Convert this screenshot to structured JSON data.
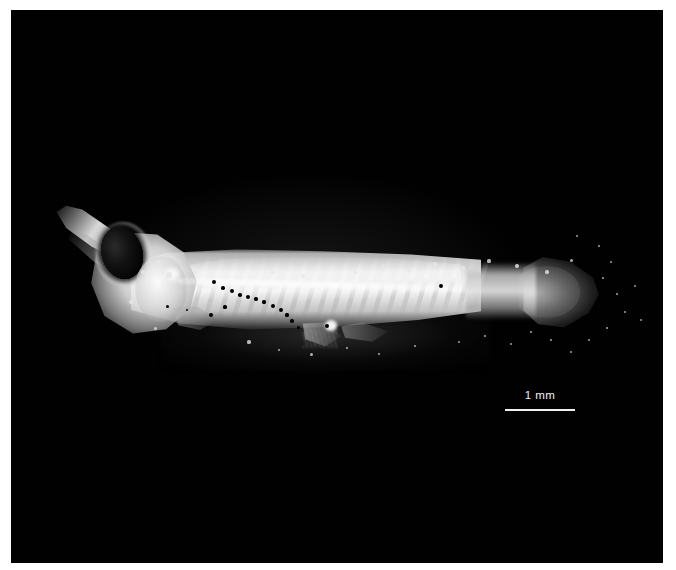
{
  "figure": {
    "background_color": "#ffffff",
    "plate_color": "#000000",
    "orientation": "lateral-left-facing"
  },
  "scale_bar": {
    "label": "1 mm",
    "length_px": 70,
    "color": "#f0f0f0"
  },
  "specimen": {
    "parts": [
      {
        "name": "snout",
        "label": "snout"
      },
      {
        "name": "eye",
        "label": "eye"
      },
      {
        "name": "head",
        "label": "head"
      },
      {
        "name": "trunk",
        "label": "trunk"
      },
      {
        "name": "caudal-fin",
        "label": "caudal fin"
      },
      {
        "name": "pectoral-fin",
        "label": "pectoral fin"
      },
      {
        "name": "pelvic-fin",
        "label": "pelvic fin"
      }
    ],
    "melanophores": [
      {
        "x": 203,
        "y": 272,
        "r": 2.0
      },
      {
        "x": 212,
        "y": 278,
        "r": 1.8
      },
      {
        "x": 221,
        "y": 281,
        "r": 2.2
      },
      {
        "x": 229,
        "y": 285,
        "r": 1.8
      },
      {
        "x": 237,
        "y": 287,
        "r": 2.0
      },
      {
        "x": 245,
        "y": 289,
        "r": 1.7
      },
      {
        "x": 253,
        "y": 292,
        "r": 1.6
      },
      {
        "x": 262,
        "y": 296,
        "r": 2.1
      },
      {
        "x": 270,
        "y": 300,
        "r": 1.9
      },
      {
        "x": 276,
        "y": 305,
        "r": 1.6
      },
      {
        "x": 281,
        "y": 311,
        "r": 1.8
      },
      {
        "x": 287,
        "y": 317,
        "r": 1.5
      },
      {
        "x": 200,
        "y": 305,
        "r": 2.4
      },
      {
        "x": 214,
        "y": 297,
        "r": 1.6
      },
      {
        "x": 316,
        "y": 316,
        "r": 2.2
      },
      {
        "x": 430,
        "y": 276,
        "r": 2.3
      },
      {
        "x": 572,
        "y": 308,
        "r": 1.8
      },
      {
        "x": 156,
        "y": 296,
        "r": 1.5
      },
      {
        "x": 176,
        "y": 300,
        "r": 1.4
      }
    ],
    "specks": [
      {
        "x": 158,
        "y": 265,
        "r": 2.6
      },
      {
        "x": 169,
        "y": 271,
        "r": 2.0
      },
      {
        "x": 184,
        "y": 262,
        "r": 1.7
      },
      {
        "x": 212,
        "y": 258,
        "r": 1.6
      },
      {
        "x": 236,
        "y": 256,
        "r": 1.5
      },
      {
        "x": 262,
        "y": 262,
        "r": 1.8
      },
      {
        "x": 292,
        "y": 266,
        "r": 2.0
      },
      {
        "x": 316,
        "y": 258,
        "r": 1.5
      },
      {
        "x": 344,
        "y": 262,
        "r": 1.8
      },
      {
        "x": 372,
        "y": 255,
        "r": 1.5
      },
      {
        "x": 398,
        "y": 260,
        "r": 1.7
      },
      {
        "x": 424,
        "y": 254,
        "r": 1.6
      },
      {
        "x": 452,
        "y": 258,
        "r": 1.9
      },
      {
        "x": 478,
        "y": 251,
        "r": 1.6
      },
      {
        "x": 506,
        "y": 256,
        "r": 1.8
      },
      {
        "x": 536,
        "y": 262,
        "r": 1.6
      },
      {
        "x": 560,
        "y": 250,
        "r": 1.5
      },
      {
        "x": 592,
        "y": 268,
        "r": 1.4
      },
      {
        "x": 606,
        "y": 284,
        "r": 1.3
      },
      {
        "x": 614,
        "y": 302,
        "r": 1.2
      },
      {
        "x": 596,
        "y": 318,
        "r": 1.4
      },
      {
        "x": 578,
        "y": 330,
        "r": 1.3
      },
      {
        "x": 560,
        "y": 342,
        "r": 1.2
      },
      {
        "x": 540,
        "y": 330,
        "r": 1.3
      },
      {
        "x": 520,
        "y": 322,
        "r": 1.4
      },
      {
        "x": 500,
        "y": 334,
        "r": 1.2
      },
      {
        "x": 474,
        "y": 326,
        "r": 1.3
      },
      {
        "x": 448,
        "y": 332,
        "r": 1.2
      },
      {
        "x": 600,
        "y": 252,
        "r": 1.2
      },
      {
        "x": 624,
        "y": 276,
        "r": 1.1
      },
      {
        "x": 630,
        "y": 310,
        "r": 1.1
      },
      {
        "x": 588,
        "y": 236,
        "r": 1.3
      },
      {
        "x": 566,
        "y": 226,
        "r": 1.2
      },
      {
        "x": 238,
        "y": 332,
        "r": 1.6
      },
      {
        "x": 268,
        "y": 340,
        "r": 1.4
      },
      {
        "x": 300,
        "y": 344,
        "r": 1.5
      },
      {
        "x": 336,
        "y": 338,
        "r": 1.4
      },
      {
        "x": 368,
        "y": 344,
        "r": 1.3
      },
      {
        "x": 404,
        "y": 336,
        "r": 1.4
      },
      {
        "x": 144,
        "y": 318,
        "r": 1.5
      },
      {
        "x": 120,
        "y": 292,
        "r": 1.8
      },
      {
        "x": 132,
        "y": 262,
        "r": 2.2
      },
      {
        "x": 148,
        "y": 252,
        "r": 1.6
      }
    ]
  }
}
